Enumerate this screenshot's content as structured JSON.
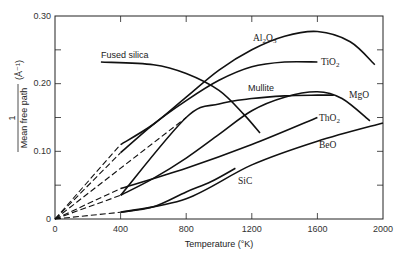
{
  "chart_data": {
    "type": "line",
    "title": "",
    "xlabel": "Temperature (°K)",
    "ylabel": "1 / Mean free path (Å⁻¹)",
    "xlim": [
      0,
      2000
    ],
    "ylim": [
      0,
      0.3
    ],
    "x_ticks": [
      "0",
      "400",
      "800",
      "1200",
      "1600",
      "2000"
    ],
    "y_ticks": [
      "0",
      "0.10",
      "0.20",
      "0.30"
    ],
    "grid": false,
    "legend": "inline labels",
    "series": [
      {
        "name": "Fused silica",
        "style": "solid",
        "x": [
          280,
          600,
          800,
          1000,
          1150,
          1250
        ],
        "y": [
          0.232,
          0.228,
          0.215,
          0.19,
          0.155,
          0.127
        ]
      },
      {
        "name": "Al2O3",
        "style": "solid",
        "dashed_from_origin_to": 400,
        "x": [
          400,
          600,
          800,
          1000,
          1200,
          1400,
          1600,
          1800,
          1950
        ],
        "y": [
          0.11,
          0.14,
          0.18,
          0.22,
          0.25,
          0.27,
          0.277,
          0.262,
          0.228
        ]
      },
      {
        "name": "TiO2",
        "style": "solid",
        "dashed_from_origin_to": 400,
        "x": [
          400,
          600,
          800,
          1000,
          1200,
          1400,
          1600
        ],
        "y": [
          0.098,
          0.14,
          0.175,
          0.205,
          0.225,
          0.232,
          0.232
        ]
      },
      {
        "name": "Mullite",
        "style": "solid",
        "dashed_from_origin_to": 800,
        "x": [
          400,
          800,
          1000,
          1200,
          1400,
          1600,
          1700
        ],
        "y": [
          0.035,
          0.15,
          0.17,
          0.178,
          0.182,
          0.183,
          0.183
        ]
      },
      {
        "name": "MgO",
        "style": "solid",
        "dashed_from_origin_to": 400,
        "x": [
          400,
          600,
          800,
          1000,
          1200,
          1400,
          1600,
          1750,
          1920
        ],
        "y": [
          0.035,
          0.06,
          0.09,
          0.125,
          0.16,
          0.18,
          0.188,
          0.178,
          0.145
        ]
      },
      {
        "name": "ThO2",
        "style": "solid",
        "dashed_from_origin_to": 400,
        "x": [
          400,
          800,
          1200,
          1600
        ],
        "y": [
          0.045,
          0.075,
          0.11,
          0.15
        ]
      },
      {
        "name": "BeO",
        "style": "solid",
        "dashed_from_origin_to": 1000,
        "x": [
          400,
          800,
          1200,
          1600,
          2000
        ],
        "y": [
          0.01,
          0.03,
          0.08,
          0.115,
          0.142
        ]
      },
      {
        "name": "SiC",
        "style": "solid",
        "x": [
          400,
          600,
          800,
          950,
          1100
        ],
        "y": [
          0.01,
          0.018,
          0.04,
          0.055,
          0.075
        ]
      }
    ]
  },
  "labels": {
    "fused_silica": "Fused silica",
    "al2o3": "Al",
    "tio2": "TiO",
    "mullite": "Mullite",
    "mgo": "MgO",
    "tho2": "ThO",
    "beo": "BeO",
    "sic": "SiC",
    "sub2": "2",
    "sub3": "3"
  },
  "axes": {
    "xlabel": "Temperature (°K)",
    "ylabel_num": "1",
    "ylabel_den": "Mean free path",
    "ylabel_unit": "(Å⁻¹)",
    "xt": [
      "0",
      "400",
      "800",
      "1200",
      "1600",
      "2000"
    ],
    "yt": [
      "0",
      "0.10",
      "0.20",
      "0.30"
    ]
  }
}
